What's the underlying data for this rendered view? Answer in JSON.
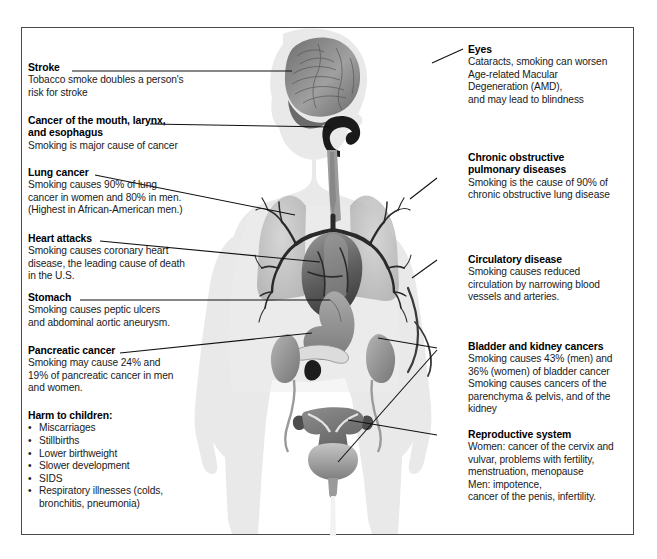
{
  "figure": {
    "body_fill": "#e9e9e9",
    "organ_dark": "#4f4f4f",
    "organ_mid": "#8c8c8c",
    "organ_light": "#bdbdbd",
    "leader_color": "#111111",
    "frame_color": "#4a4a4a"
  },
  "left_labels": [
    {
      "name": "stroke",
      "heading": "Stroke",
      "lines": [
        "Tobacco smoke doubles a person's",
        "risk for stroke"
      ]
    },
    {
      "name": "cancer-mouth-larynx-esophagus",
      "heading": "Cancer of the mouth, larynx,",
      "heading2": "and esophagus",
      "lines": [
        "Smoking is major cause of cancer"
      ]
    },
    {
      "name": "lung-cancer",
      "heading": "Lung cancer",
      "lines": [
        "Smoking causes 90% of lung",
        "cancer in women and 80% in men.",
        "(Highest in African-American men.)"
      ]
    },
    {
      "name": "heart-attacks",
      "heading": "Heart attacks",
      "lines": [
        "Smoking causes coronary heart",
        "disease, the leading cause of death",
        "in the U.S."
      ]
    },
    {
      "name": "stomach",
      "heading": "Stomach",
      "lines": [
        "Smoking causes peptic ulcers",
        "and abdominal aortic aneurysm."
      ]
    },
    {
      "name": "pancreatic-cancer",
      "heading": "Pancreatic cancer",
      "lines": [
        "Smoking may cause 24% and",
        "19% of pancreatic cancer in men",
        "and women."
      ]
    }
  ],
  "harm_to_children": {
    "heading": "Harm to children:",
    "items": [
      "Miscarriages",
      "Stillbirths",
      "Lower birthweight",
      "Slower development",
      "SIDS",
      "Respiratory illnesses (colds,"
    ],
    "continuation": "bronchitis, pneumonia)"
  },
  "right_labels": [
    {
      "name": "eyes",
      "heading": "Eyes",
      "lines": [
        "Cataracts, smoking can worsen",
        "Age-related Macular",
        "Degeneration (AMD),",
        "and may lead to blindness"
      ]
    },
    {
      "name": "chronic-obstructive-pulmonary-diseases",
      "heading": "Chronic obstructive",
      "heading2": "pulmonary diseases",
      "lines": [
        "Smoking is the cause of 90% of",
        "chronic obstructive lung disease"
      ]
    },
    {
      "name": "circulatory-disease",
      "heading": "Circulatory disease",
      "lines": [
        "Smoking causes reduced",
        "circulation by narrowing blood",
        "vessels and arteries."
      ]
    },
    {
      "name": "bladder-and-kidney-cancers",
      "heading": "Bladder and kidney cancers",
      "lines": [
        "Smoking causes 43% (men) and",
        "36% (women) of bladder cancer",
        "Smoking causes cancers of the",
        "parenchyma & pelvis, and of the",
        "kidney"
      ]
    },
    {
      "name": "reproductive-system",
      "heading": "Reproductive system",
      "lines": [
        "Women: cancer of the cervix and",
        "vulvar, problems with fertility,",
        "menstruation, menopause",
        "Men: impotence,",
        "cancer of the penis, infertility."
      ]
    }
  ],
  "anatomy": [
    {
      "name": "brain",
      "label": "brain"
    },
    {
      "name": "mouth-throat",
      "label": "mouth, larynx and esophagus"
    },
    {
      "name": "lungs",
      "label": "lungs"
    },
    {
      "name": "bronchial-tree",
      "label": "bronchial tree"
    },
    {
      "name": "heart",
      "label": "heart"
    },
    {
      "name": "stomach",
      "label": "stomach"
    },
    {
      "name": "pancreas",
      "label": "pancreas"
    },
    {
      "name": "kidneys",
      "label": "kidneys"
    },
    {
      "name": "blood-vessel",
      "label": "artery"
    },
    {
      "name": "bladder",
      "label": "bladder"
    },
    {
      "name": "uterus-ovaries",
      "label": "uterus and ovaries"
    }
  ]
}
